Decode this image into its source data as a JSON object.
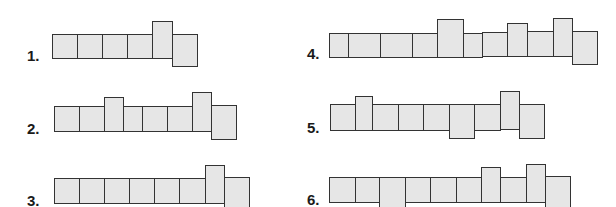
{
  "colors": {
    "fill": "#e6e6e6",
    "stroke": "#333333",
    "label": "#1a1a1a"
  },
  "figures": [
    {
      "label": "1.",
      "label_pos": [
        27,
        48
      ],
      "cells": [
        {
          "x": 52,
          "w": 25,
          "top": 34,
          "bottom": 59
        },
        {
          "x": 77,
          "w": 25,
          "top": 34,
          "bottom": 59
        },
        {
          "x": 102,
          "w": 25,
          "top": 34,
          "bottom": 59
        },
        {
          "x": 127,
          "w": 25,
          "top": 34,
          "bottom": 59
        },
        {
          "x": 152,
          "w": 20,
          "top": 21,
          "bottom": 59
        },
        {
          "x": 172,
          "w": 25,
          "top": 34,
          "bottom": 67
        }
      ]
    },
    {
      "label": "2.",
      "label_pos": [
        27,
        121
      ],
      "cells": [
        {
          "x": 54,
          "w": 25,
          "top": 106,
          "bottom": 132
        },
        {
          "x": 79,
          "w": 25,
          "top": 106,
          "bottom": 132
        },
        {
          "x": 104,
          "w": 19,
          "top": 97,
          "bottom": 132
        },
        {
          "x": 123,
          "w": 19,
          "top": 106,
          "bottom": 132
        },
        {
          "x": 142,
          "w": 25,
          "top": 106,
          "bottom": 132
        },
        {
          "x": 167,
          "w": 25,
          "top": 106,
          "bottom": 132
        },
        {
          "x": 192,
          "w": 19,
          "top": 92,
          "bottom": 132
        },
        {
          "x": 211,
          "w": 25,
          "top": 105,
          "bottom": 140
        }
      ]
    },
    {
      "label": "3.",
      "label_pos": [
        27,
        193
      ],
      "cells": [
        {
          "x": 54,
          "w": 25,
          "top": 178,
          "bottom": 204
        },
        {
          "x": 79,
          "w": 25,
          "top": 178,
          "bottom": 204
        },
        {
          "x": 104,
          "w": 25,
          "top": 178,
          "bottom": 204
        },
        {
          "x": 129,
          "w": 25,
          "top": 178,
          "bottom": 204
        },
        {
          "x": 154,
          "w": 25,
          "top": 178,
          "bottom": 204
        },
        {
          "x": 179,
          "w": 26,
          "top": 178,
          "bottom": 204
        },
        {
          "x": 205,
          "w": 19,
          "top": 165,
          "bottom": 204
        },
        {
          "x": 224,
          "w": 25,
          "top": 177,
          "bottom": 212
        }
      ]
    },
    {
      "label": "4.",
      "label_pos": [
        307,
        46
      ],
      "cells": [
        {
          "x": 329,
          "w": 19,
          "top": 33,
          "bottom": 58
        },
        {
          "x": 348,
          "w": 32,
          "top": 33,
          "bottom": 58
        },
        {
          "x": 380,
          "w": 32,
          "top": 33,
          "bottom": 58
        },
        {
          "x": 412,
          "w": 25,
          "top": 33,
          "bottom": 58
        },
        {
          "x": 437,
          "w": 26,
          "top": 19,
          "bottom": 58
        },
        {
          "x": 463,
          "w": 19,
          "top": 33,
          "bottom": 58
        },
        {
          "x": 482,
          "w": 25,
          "top": 32,
          "bottom": 57
        },
        {
          "x": 507,
          "w": 20,
          "top": 23,
          "bottom": 57
        },
        {
          "x": 527,
          "w": 26,
          "top": 31,
          "bottom": 57
        },
        {
          "x": 553,
          "w": 19,
          "top": 18,
          "bottom": 57
        },
        {
          "x": 572,
          "w": 25,
          "top": 31,
          "bottom": 65
        }
      ]
    },
    {
      "label": "5.",
      "label_pos": [
        307,
        120
      ],
      "cells": [
        {
          "x": 330,
          "w": 25,
          "top": 104,
          "bottom": 131
        },
        {
          "x": 355,
          "w": 17,
          "top": 96,
          "bottom": 131
        },
        {
          "x": 372,
          "w": 26,
          "top": 104,
          "bottom": 131
        },
        {
          "x": 398,
          "w": 25,
          "top": 104,
          "bottom": 131
        },
        {
          "x": 423,
          "w": 26,
          "top": 104,
          "bottom": 131
        },
        {
          "x": 449,
          "w": 25,
          "top": 104,
          "bottom": 139
        },
        {
          "x": 474,
          "w": 26,
          "top": 104,
          "bottom": 131
        },
        {
          "x": 500,
          "w": 19,
          "top": 91,
          "bottom": 130
        },
        {
          "x": 519,
          "w": 25,
          "top": 104,
          "bottom": 139
        }
      ]
    },
    {
      "label": "6.",
      "label_pos": [
        307,
        192
      ],
      "cells": [
        {
          "x": 329,
          "w": 26,
          "top": 177,
          "bottom": 203
        },
        {
          "x": 355,
          "w": 24,
          "top": 177,
          "bottom": 203
        },
        {
          "x": 379,
          "w": 26,
          "top": 177,
          "bottom": 212
        },
        {
          "x": 405,
          "w": 25,
          "top": 177,
          "bottom": 203
        },
        {
          "x": 430,
          "w": 26,
          "top": 177,
          "bottom": 203
        },
        {
          "x": 456,
          "w": 25,
          "top": 177,
          "bottom": 203
        },
        {
          "x": 481,
          "w": 19,
          "top": 167,
          "bottom": 203
        },
        {
          "x": 500,
          "w": 26,
          "top": 177,
          "bottom": 203
        },
        {
          "x": 526,
          "w": 19,
          "top": 164,
          "bottom": 203
        },
        {
          "x": 545,
          "w": 25,
          "top": 176,
          "bottom": 212
        }
      ]
    }
  ]
}
